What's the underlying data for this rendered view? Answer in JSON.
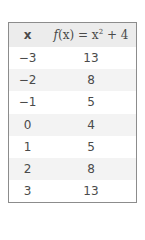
{
  "table": {
    "headers": {
      "x": "x",
      "fx_func": "f",
      "fx_arg": "(x)",
      "fx_eq": " = x",
      "fx_exp": "2",
      "fx_tail": " + 4"
    },
    "rows": [
      {
        "x": "−3",
        "fx": "13"
      },
      {
        "x": "−2",
        "fx": "8"
      },
      {
        "x": "−1",
        "fx": "5"
      },
      {
        "x": "0",
        "fx": "4"
      },
      {
        "x": "1",
        "fx": "5"
      },
      {
        "x": "2",
        "fx": "8"
      },
      {
        "x": "3",
        "fx": "13"
      }
    ]
  }
}
